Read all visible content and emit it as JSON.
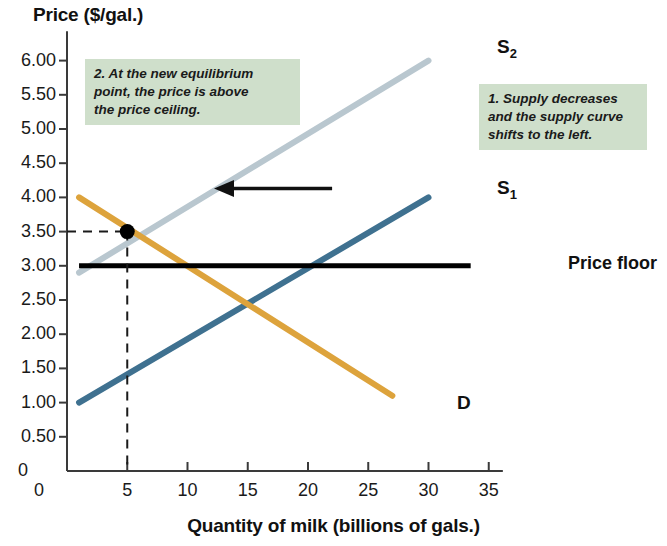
{
  "chart_data": {
    "type": "line",
    "title": "",
    "xlabel": "Quantity of milk (billions of gals.)",
    "ylabel": "Price ($/gal.)",
    "xlim": [
      0,
      37
    ],
    "ylim": [
      0,
      6.4
    ],
    "grid": false,
    "legend_position": "inline-curve-labels",
    "xticks": [
      "0",
      "5",
      "10",
      "15",
      "20",
      "25",
      "30",
      "35"
    ],
    "xtick_values": [
      0,
      5,
      10,
      15,
      20,
      25,
      30,
      35
    ],
    "yticks": [
      "0",
      "0.50",
      "1.00",
      "1.50",
      "2.00",
      "2.50",
      "3.00",
      "3.50",
      "4.00",
      "4.50",
      "5.00",
      "5.50",
      "6.00"
    ],
    "ytick_values": [
      0,
      0.5,
      1.0,
      1.5,
      2.0,
      2.5,
      3.0,
      3.5,
      4.0,
      4.5,
      5.0,
      5.5,
      6.0
    ],
    "series": [
      {
        "name": "S1",
        "label": "S",
        "sub": "1",
        "color": "#3f7190",
        "points": [
          [
            1,
            1.0
          ],
          [
            30,
            4.0
          ]
        ],
        "label_x": 30.8,
        "label_y": 4.25
      },
      {
        "name": "S2",
        "label": "S",
        "sub": "2",
        "color": "#b9c7cf",
        "points": [
          [
            1,
            2.9
          ],
          [
            30,
            6.0
          ]
        ],
        "label_x": 30.8,
        "label_y": 6.25
      },
      {
        "name": "D",
        "label": "D",
        "sub": "",
        "color": "#dda33c",
        "points": [
          [
            1,
            4.0
          ],
          [
            27,
            1.1
          ]
        ],
        "label_x": 27.9,
        "label_y": 1.1
      }
    ],
    "horizontal_lines": [
      {
        "name": "price-floor",
        "label": "Price floor",
        "y": 3.0,
        "x_start": 1,
        "x_end": 33.5,
        "color": "#000000"
      }
    ],
    "equilibrium_point": {
      "name": "new-equilibrium",
      "x": 5,
      "y": 3.5,
      "dashed_to_y_axis": true,
      "dashed_to_x_axis": true
    },
    "arrow": {
      "name": "shift-left-arrow",
      "direction": "left",
      "x_start": 22.0,
      "x_end": 12.2,
      "y": 4.13
    },
    "annotations": [
      {
        "name": "annotation-equilibrium-price",
        "number": "2.",
        "text": "2. At the new equilibrium point, the price is above the price ceiling.",
        "box_color": "#cfdfcb"
      },
      {
        "name": "annotation-supply-shift",
        "number": "1.",
        "text": "1. Supply decreases and the supply curve shifts to the left.",
        "box_color": "#cfdfcb"
      }
    ]
  },
  "axis": {
    "y_title": "Price ($/gal.)",
    "x_title": "Quantity of milk (billions of gals.)",
    "origin_label": "0"
  },
  "notes": {
    "note1_line1": "1. Supply decreases",
    "note1_line2": "and the supply curve",
    "note1_line3": "shifts to the left.",
    "note2_line1": "2. At the new equilibrium",
    "note2_line2": "point, the price is above",
    "note2_line3": "the price ceiling."
  },
  "labels": {
    "price_floor": "Price floor",
    "s1_base": "S",
    "s1_sub": "1",
    "s2_base": "S",
    "s2_sub": "2",
    "demand": "D"
  },
  "colors": {
    "s1": "#3f7190",
    "s2": "#b9c7cf",
    "demand": "#dda33c",
    "price_floor": "#000000",
    "note_box": "#cfdfcb",
    "axis": "#3a3a3a"
  }
}
